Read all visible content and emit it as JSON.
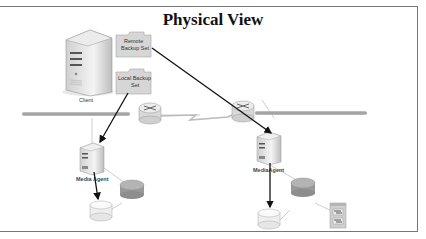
{
  "title": "Physical View",
  "nodes": {
    "client": {
      "label": "Client",
      "icon": "server-tower-icon"
    },
    "remote_backup": {
      "label_line1": "Remote",
      "label_line2": "Backup Set",
      "icon": "folder-icon"
    },
    "local_backup": {
      "label_line1": "Local Backup",
      "label_line2": "Set",
      "icon": "folder-icon"
    },
    "router_left": {
      "icon": "router-icon"
    },
    "router_right": {
      "icon": "router-icon"
    },
    "wan_link": {
      "icon": "lightning-link-icon"
    },
    "media_agent_left": {
      "label": "Media Agent",
      "icon": "server-icon"
    },
    "media_agent_right": {
      "label": "MediaAgent",
      "icon": "server-icon"
    },
    "disk_left": {
      "icon": "disk-storage-icon"
    },
    "switch_left": {
      "icon": "hub-icon"
    },
    "disk_right": {
      "icon": "disk-storage-icon"
    },
    "switch_right": {
      "icon": "hub-icon"
    },
    "tape_library": {
      "icon": "tape-library-icon"
    }
  },
  "colors": {
    "frame": "#777777",
    "arrow": "#111111",
    "link": "#cccccc",
    "device_fill": "#e4e4e4",
    "folder_fill": "#d8d8d8",
    "hub_fill": "#a8a8a8"
  }
}
